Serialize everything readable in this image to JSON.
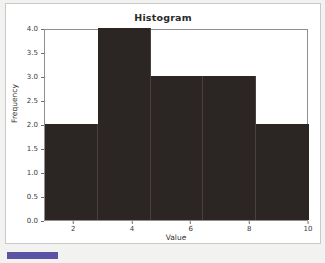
{
  "chart_data": {
    "type": "bar",
    "title": "Histogram",
    "xlabel": "Value",
    "ylabel": "Frequency",
    "categories": [
      "1.0-2.8",
      "2.8-4.6",
      "4.6-6.4",
      "6.4-8.2",
      "8.2-10.0"
    ],
    "bin_edges": [
      1.0,
      2.8,
      4.6,
      6.4,
      8.2,
      10.0
    ],
    "values": [
      2,
      4,
      3,
      3,
      2
    ],
    "xlim": [
      1.0,
      10.0
    ],
    "ylim": [
      0.0,
      4.0
    ],
    "x_ticks": [
      "2",
      "4",
      "6",
      "8",
      "10"
    ],
    "x_tick_values": [
      2,
      4,
      6,
      8,
      10
    ],
    "y_ticks": [
      "0.0",
      "0.5",
      "1.0",
      "1.5",
      "2.0",
      "2.5",
      "3.0",
      "3.5",
      "4.0"
    ],
    "y_tick_values": [
      0.0,
      0.5,
      1.0,
      1.5,
      2.0,
      2.5,
      3.0,
      3.5,
      4.0
    ],
    "grid": false,
    "legend": null,
    "bar_color": "#2b2523",
    "plot_background": "#ffffff"
  },
  "footer": {
    "accent_color": "#5b54a4",
    "text": ""
  }
}
